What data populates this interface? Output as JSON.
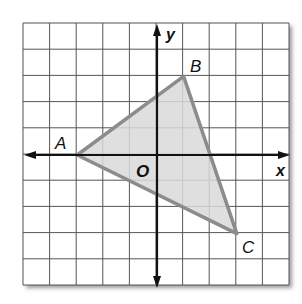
{
  "figure": {
    "axes": {
      "x_label": "x",
      "y_label": "y",
      "origin_label": "O"
    },
    "grid": {
      "columns": 10,
      "rows": 10,
      "x_range": [
        -5,
        5
      ],
      "y_range": [
        -5,
        5
      ]
    },
    "triangle": {
      "fill": "#d9d9d9",
      "stroke": "#8c8c8c",
      "vertices": [
        {
          "label": "A",
          "x": -3,
          "y": 0
        },
        {
          "label": "B",
          "x": 1,
          "y": 3
        },
        {
          "label": "C",
          "x": 3,
          "y": -3
        }
      ]
    }
  }
}
